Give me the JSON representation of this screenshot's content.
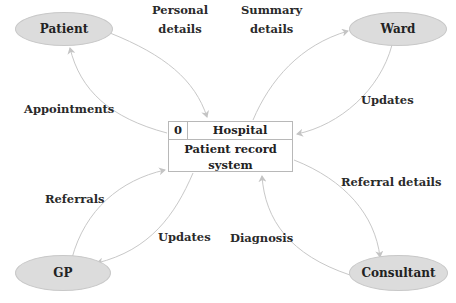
{
  "diagram": {
    "type": "data-flow-diagram",
    "process": {
      "id": "0",
      "location": "Hospital",
      "name": "Patient record system"
    },
    "entities": {
      "patient": "Patient",
      "ward": "Ward",
      "gp": "GP",
      "consultant": "Consultant"
    },
    "flows": {
      "personal_details": {
        "line1": "Personal",
        "line2": "details",
        "from": "Patient",
        "to": "Patient record system"
      },
      "appointments": {
        "label": "Appointments",
        "from": "Patient record system",
        "to": "Patient"
      },
      "summary_details": {
        "line1": "Summary",
        "line2": "details",
        "from": "Patient record system",
        "to": "Ward"
      },
      "ward_updates": {
        "label": "Updates",
        "from": "Ward",
        "to": "Patient record system"
      },
      "referrals": {
        "label": "Referrals",
        "from": "GP",
        "to": "Patient record system"
      },
      "gp_updates": {
        "label": "Updates",
        "from": "Patient record system",
        "to": "GP"
      },
      "referral_details": {
        "label": "Referral details",
        "from": "Patient record system",
        "to": "Consultant"
      },
      "diagnosis": {
        "label": "Diagnosis",
        "from": "Consultant",
        "to": "Patient record system"
      }
    },
    "colors": {
      "entity_fill": "#dcdcdc",
      "line": "#c4c4c4",
      "text": "#222222"
    }
  }
}
